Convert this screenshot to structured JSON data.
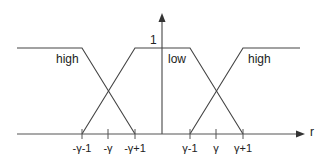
{
  "diagram": {
    "type": "membership-functions",
    "x_axis_label": "r",
    "y_max_label": "1",
    "set_labels": {
      "left_high": "high",
      "low": "low",
      "right_high": "high"
    },
    "ticks": [
      {
        "label": "-γ-1",
        "x": 82
      },
      {
        "label": "-γ",
        "x": 108
      },
      {
        "label": "-γ+1",
        "x": 135
      },
      {
        "label": "γ-1",
        "x": 190
      },
      {
        "label": "γ",
        "x": 216
      },
      {
        "label": "γ+1",
        "x": 243
      }
    ],
    "colors": {
      "line": "#444444",
      "axis": "#555555",
      "text": "#222222"
    }
  }
}
